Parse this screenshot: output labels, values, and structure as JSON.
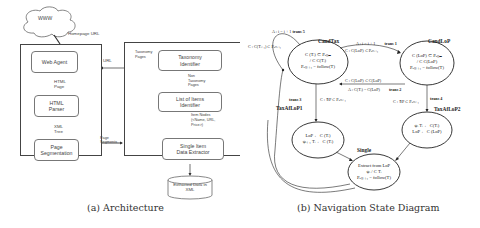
{
  "architecture": {
    "cloud_label": "WWW",
    "homepage_url_label": "Homepage URL",
    "url_label": "URL",
    "page_segments_label": "Page\nSegments",
    "left_modules": [
      {
        "id": "web-agent",
        "label": "Web Agent"
      },
      {
        "id": "html-parser",
        "label": "HTML\nParser"
      },
      {
        "id": "page-segmentation",
        "label": "Page\nSegmentation"
      }
    ],
    "left_edges": [
      {
        "label": "HTML\nPage"
      },
      {
        "label": "XML\nTree"
      }
    ],
    "right_modules": [
      {
        "id": "taxonomy-identifier",
        "label": "Taxonomy\nIdentifier"
      },
      {
        "id": "list-of-items-identifier",
        "label": "List of Items\nIdentifier"
      },
      {
        "id": "single-item-data-extractor",
        "label": "Single Item\nData Extractor"
      }
    ],
    "taxonomy_pages_label": "Taxonomy\nPages",
    "non_taxonomy_pages_label": "Non\nTaxonomy\nPages",
    "item_nodes_label": "Item Nodes\n(<Name, URL,\nPrice>)",
    "output_db_label": "Extracted Data in\nXML",
    "caption": "(a) Architecture"
  },
  "state_diagram": {
    "states": [
      {
        "id": "CandTax",
        "name": "CandTax",
        "text": "C (Tᵢ) ⊂ Pₐₜₜₘ\n/ C C(Tᵢ)\nPₐₜₜᵢ₊₁ = follow(T)"
      },
      {
        "id": "CandLoP",
        "name": "CandLoP",
        "text": "C (LoP) ⊂ Pₐₜₜₘ\n/ C C(LoP)\nPₐₜₜᵢ₊₁ = follow(T)"
      },
      {
        "id": "TaxAfLoP1",
        "name": "TaxAfLoP1",
        "text": "LoP ← C (Tᵢ)\nψᵢ₊₁ Tᵢ ← C (Tᵢ)"
      },
      {
        "id": "TaxAfLoP2",
        "name": "TaxAfLoP2",
        "text": "ψᵢ Tᵢ ← C(Tᵢ)\nLoP ← C (LoP)"
      },
      {
        "id": "Single",
        "name": "Single",
        "text": "Extract from LoP\nψᵢ / C Tᵢ\nPₐₜₜᵢ₊₁ = follow(T)"
      }
    ],
    "transitions": [
      {
        "id": "trans5",
        "name": "trans 5",
        "action": "A : i = i + 1",
        "condition": "C : C(Tᵢ₊₁) ⊂ Pₐₜₜᵢ₊₁"
      },
      {
        "id": "trans1",
        "name": "trans 1",
        "action": "A : i = i + 1",
        "condition": "C : C(LoP) ⊂ Pₐₜₜᵢ₊₁"
      },
      {
        "id": "trans2",
        "name": "trans 2",
        "action": "A : C(Tᵢ) = C(LoP)",
        "condition": "C : C(LoP) ⊂ C(LoP)"
      },
      {
        "id": "trans3",
        "name": "trans 3",
        "action": "",
        "condition": "C : ∃P ⊂ Pₐₜₜᵢ₊₁"
      },
      {
        "id": "trans4",
        "name": "trans 4",
        "action": "",
        "condition": "C : ∃P ⊂ Pₐₜₜᵢ₊₁"
      }
    ],
    "caption": "(b) Navigation State Diagram"
  }
}
